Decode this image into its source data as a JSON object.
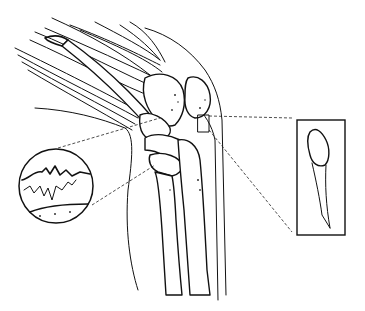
{
  "figure": {
    "type": "anatomical line illustration",
    "background_color": "#ffffff",
    "line_color": "#111111",
    "insets": [
      {
        "id": "circular-magnified-inset",
        "shape": "circle",
        "depicts": "magnified jagged surface / fracture line"
      },
      {
        "id": "rectangular-inset",
        "shape": "rectangle",
        "depicts": "isolated bone fragment"
      }
    ],
    "callout_lines": "dashed"
  }
}
